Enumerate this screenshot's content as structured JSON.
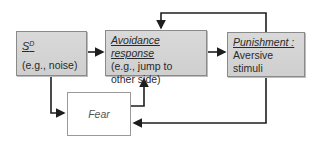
{
  "diagram": {
    "nodes": {
      "sd": {
        "title": "S",
        "superscript": "D",
        "subtitle": "(e.g., noise)"
      },
      "avoidance": {
        "title": "Avoidance response",
        "line1": "(e.g., jump to",
        "line2": "other side)"
      },
      "punishment": {
        "title": "Punishment :",
        "line1": "Aversive",
        "line2": "stimuli"
      },
      "fear": {
        "title": "Fear"
      }
    },
    "edges": [
      {
        "from": "sd",
        "to": "avoidance"
      },
      {
        "from": "sd",
        "to": "fear"
      },
      {
        "from": "fear",
        "to": "avoidance"
      },
      {
        "from": "avoidance",
        "to": "punishment"
      },
      {
        "from": "punishment",
        "to": "avoidance"
      },
      {
        "from": "punishment",
        "to": "fear"
      }
    ],
    "colors": {
      "box_fill": "#d4d4d4",
      "box_border": "#8a8a8a",
      "line": "#1e1e1e"
    }
  }
}
